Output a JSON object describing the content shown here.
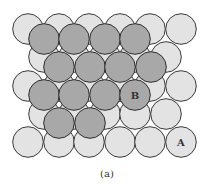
{
  "figure": {
    "caption": "(a)",
    "radius": 15.3,
    "colors": {
      "layer_a": "#e3e3e3",
      "layer_b": "#a8a8a8",
      "stroke": "#333333"
    },
    "layer_a": [
      [
        28,
        29
      ],
      [
        59,
        29
      ],
      [
        89,
        29
      ],
      [
        120,
        29
      ],
      [
        150,
        29
      ],
      [
        181,
        29
      ],
      [
        44,
        57
      ],
      [
        74,
        57
      ],
      [
        105,
        57
      ],
      [
        135,
        57
      ],
      [
        166,
        57
      ],
      [
        28,
        86
      ],
      [
        59,
        86
      ],
      [
        89,
        86
      ],
      [
        120,
        86
      ],
      [
        150,
        86
      ],
      [
        181,
        86
      ],
      [
        44,
        114
      ],
      [
        74,
        114
      ],
      [
        105,
        114
      ],
      [
        135,
        114
      ],
      [
        166,
        114
      ],
      [
        28,
        142
      ],
      [
        59,
        142
      ],
      [
        89,
        142
      ],
      [
        120,
        142
      ],
      [
        150,
        142
      ],
      [
        181,
        142
      ]
    ],
    "layer_b": [
      [
        44,
        39
      ],
      [
        74,
        39
      ],
      [
        105,
        39
      ],
      [
        135,
        39
      ],
      [
        59,
        67
      ],
      [
        90,
        67
      ],
      [
        120,
        67
      ],
      [
        151,
        67
      ],
      [
        44,
        95
      ],
      [
        74,
        95
      ],
      [
        105,
        95
      ],
      [
        135,
        95
      ],
      [
        59,
        123
      ],
      [
        90,
        123
      ]
    ],
    "labels": [
      {
        "text": "B",
        "x": 135,
        "y": 99
      },
      {
        "text": "A",
        "x": 181,
        "y": 146
      }
    ]
  }
}
